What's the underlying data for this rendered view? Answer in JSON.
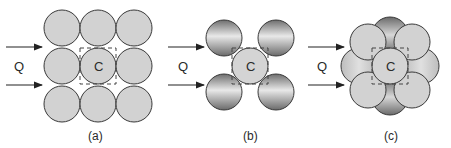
{
  "figure": {
    "panels": [
      {
        "id": "a",
        "caption": "(a)",
        "flow_label": "Q",
        "center_label": "C",
        "arrangement": "3x3 square packing, all spheres same size and same flat grey shading",
        "sphere_count": 9
      },
      {
        "id": "b",
        "caption": "(b)",
        "flow_label": "Q",
        "center_label": "C",
        "arrangement": "central sphere surrounded by 4 diagonal spheres with darker gradient shading",
        "sphere_count": 5
      },
      {
        "id": "c",
        "caption": "(c)",
        "flow_label": "Q",
        "center_label": "C",
        "arrangement": "central sphere with 4 diagonal spheres in front and 4 axial darker spheres behind",
        "sphere_count": 9
      }
    ],
    "colors": {
      "sphere_fill": "#d2d2d2",
      "sphere_stroke": "#3a3a3a",
      "shaded_dark": "#7a7a7a",
      "shaded_light": "#e6e6e6",
      "arrow": "#222222",
      "dashed_box": "#444444"
    }
  }
}
